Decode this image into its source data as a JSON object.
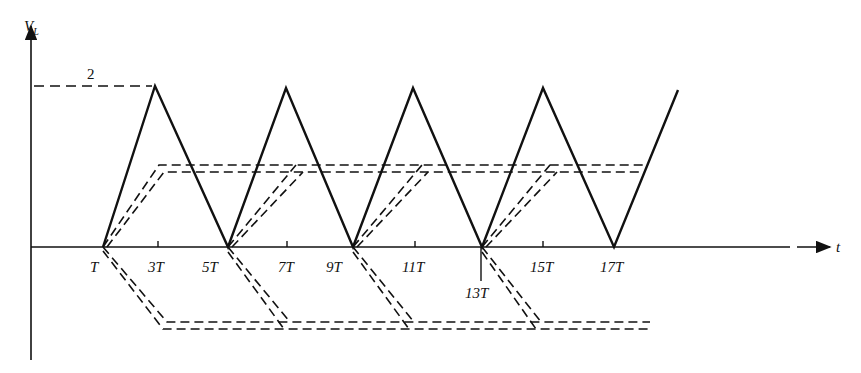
{
  "figure": {
    "y_axis_label": "V",
    "y_axis_subscript": "L",
    "x_axis_label": "t",
    "peak_value_label": "2",
    "tick_labels": [
      "T",
      "3T",
      "5T",
      "7T",
      "9T",
      "11T",
      "13T",
      "15T",
      "17T"
    ],
    "colors": {
      "ink": "#111111",
      "background": "#ffffff"
    }
  },
  "waveform": {
    "description": "triangular wave V_L between 0 and 2, zeros at T,5T,9T,13T,17T, peaks at 3T,7T,11T,15T",
    "zeros": [
      "T",
      "5T",
      "9T",
      "13T",
      "17T"
    ],
    "peaks": [
      "3T",
      "7T",
      "11T",
      "15T"
    ],
    "peak_value": 2
  }
}
